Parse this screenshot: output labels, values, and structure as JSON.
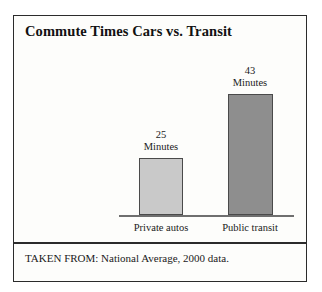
{
  "figure": {
    "title": "Commute Times Cars vs. Transit",
    "source_note": "TAKEN FROM: National Average, 2000 data.",
    "unit_label": "Minutes",
    "colors": {
      "frame": "#2b2b2b",
      "background": "#fdfdfb",
      "axis": "#6f6f6f",
      "bar_private_autos": "#c9c9c9",
      "bar_public_transit": "#8e8e8e",
      "bar_outline": "#4a4a4a",
      "text": "#1a1a1a"
    }
  },
  "chart_data": {
    "type": "bar",
    "title": "Commute Times Cars vs. Transit",
    "subtitle": "",
    "xlabel": "",
    "ylabel": "Minutes",
    "categories": [
      "Private autos",
      "Public transit"
    ],
    "values": [
      25,
      43
    ],
    "value_labels": [
      "25",
      "43"
    ],
    "unit": "Minutes",
    "point_labels": [
      {
        "number": "25",
        "unit": "Minutes"
      },
      {
        "number": "43",
        "unit": "Minutes"
      }
    ],
    "ylim": [
      0,
      50
    ],
    "grid": false,
    "legend": "none",
    "annotations": [
      "TAKEN FROM: National Average, 2000 data."
    ],
    "series": [
      {
        "name": "Average commute time",
        "values": [
          25,
          43
        ],
        "colors": [
          "#c9c9c9",
          "#8e8e8e"
        ]
      }
    ]
  }
}
